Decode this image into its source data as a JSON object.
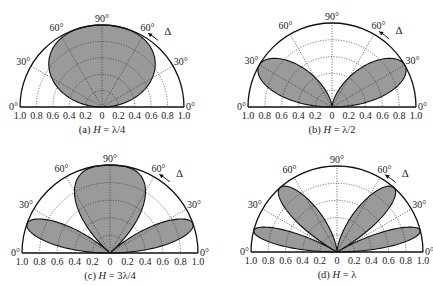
{
  "chart_data": [
    {
      "type": "polar",
      "panel": "a",
      "caption": "(a) H = λ/4",
      "caption_parts": {
        "prefix": "(a) ",
        "var": "H",
        "rest": " = λ/4"
      },
      "H_over_lambda": 0.25,
      "pattern": "|sin(2π·H/λ·sin Δ)| normalized",
      "center": [
        102,
        107
      ],
      "radius": 82
    },
    {
      "type": "polar",
      "panel": "b",
      "caption": "(b) H = λ/2",
      "caption_parts": {
        "prefix": "(b) ",
        "var": "H",
        "rest": " = λ/2"
      },
      "H_over_lambda": 0.5,
      "pattern": "|sin(2π·H/λ·sin Δ)| normalized",
      "center": [
        332,
        107
      ],
      "radius": 84
    },
    {
      "type": "polar",
      "panel": "c",
      "caption": "(c) H = 3λ/4",
      "caption_parts": {
        "prefix": "(c) ",
        "var": "H",
        "rest": " = 3λ/4"
      },
      "H_over_lambda": 0.75,
      "pattern": "|sin(2π·H/λ·sin Δ)| normalized",
      "center": [
        110,
        253
      ],
      "radius": 88
    },
    {
      "type": "polar",
      "panel": "d",
      "caption": "(d) H = λ",
      "caption_parts": {
        "prefix": "(d) ",
        "var": "H",
        "rest": " = λ"
      },
      "H_over_lambda": 1.0,
      "pattern": "|sin(2π·H/λ·sin Δ)| normalized",
      "center": [
        337,
        252
      ],
      "radius": 86
    }
  ],
  "axes": {
    "angle_labels": [
      "0°",
      "30°",
      "60°",
      "90°",
      "60°",
      "30°",
      "0°"
    ],
    "angle_degrees": [
      0,
      30,
      60,
      90,
      120,
      150,
      180
    ],
    "radial_tick_labels": [
      "1.0",
      "0.8",
      "0.6",
      "0.4",
      "0.2",
      "0",
      "0.2",
      "0.4",
      "0.6",
      "0.8",
      "1.0"
    ],
    "radial_rings": [
      0.2,
      0.4,
      0.6,
      0.8
    ],
    "angle_symbol": "Δ",
    "grid": true
  },
  "colors": {
    "fill": "#9a9a9a",
    "outline": "#111111",
    "grid": "#333333",
    "background": "#ffffff"
  }
}
